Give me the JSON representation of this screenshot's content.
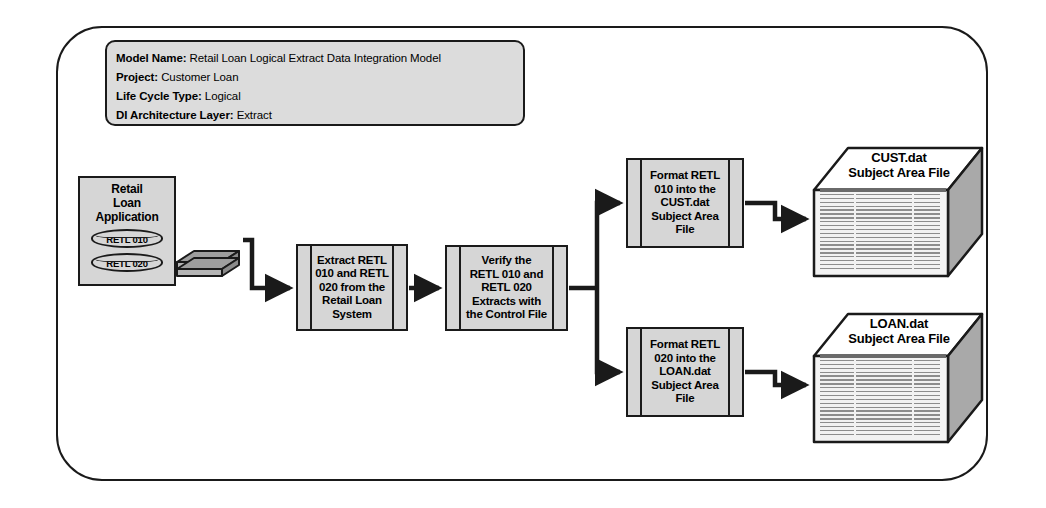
{
  "header": {
    "rows": [
      {
        "label": "Model Name:",
        "value": "Retail Loan Logical Extract Data Integration Model"
      },
      {
        "label": "Project:",
        "value": "Customer Loan"
      },
      {
        "label": "Life Cycle Type:",
        "value": "Logical"
      },
      {
        "label": "DI Architecture Layer:",
        "value": "Extract"
      }
    ]
  },
  "source": {
    "title": "Retail\nLoan\nApplication",
    "title_lines": [
      "Retail",
      "Loan",
      "Application"
    ],
    "datastores": [
      {
        "label": "RETL 010"
      },
      {
        "label": "RETL 020"
      }
    ],
    "icon": "stacked-disk-icon"
  },
  "processes": [
    {
      "id": "extract",
      "text": "Extract RETL 010 and RETL 020 from the Retail Loan System",
      "lines": [
        "Extract RETL",
        "010 and RETL",
        "020 from the",
        "Retail Loan",
        "System"
      ]
    },
    {
      "id": "verify",
      "text": "Verify the RETL 010 and RETL 020 Extracts with the Control File",
      "lines": [
        "Verify the",
        "RETL 010 and",
        "RETL 020",
        "Extracts with",
        "the Control File"
      ]
    },
    {
      "id": "format-cust",
      "text": "Format RETL 010 into the CUST.dat Subject Area File",
      "lines": [
        "Format RETL",
        "010 into the",
        "CUST.dat",
        "Subject Area",
        "File"
      ]
    },
    {
      "id": "format-loan",
      "text": "Format RETL 020 into the LOAN.dat Subject Area File",
      "lines": [
        "Format RETL",
        "020 into the",
        "LOAN.dat",
        "Subject Area",
        "File"
      ]
    }
  ],
  "outputs": [
    {
      "id": "cust",
      "name": "CUST.dat",
      "subtitle": "Subject Area File",
      "label_lines": [
        "CUST.dat",
        "Subject Area File"
      ]
    },
    {
      "id": "loan",
      "name": "LOAN.dat",
      "subtitle": "Subject Area File",
      "label_lines": [
        "LOAN.dat",
        "Subject Area File"
      ]
    }
  ],
  "colors": {
    "shape_fill": "#d6d6d6",
    "header_fill": "#dcdcdc",
    "stroke": "#1a1a1a",
    "page_background": "#ffffff",
    "box_side_fill": "#a9a9a9"
  }
}
